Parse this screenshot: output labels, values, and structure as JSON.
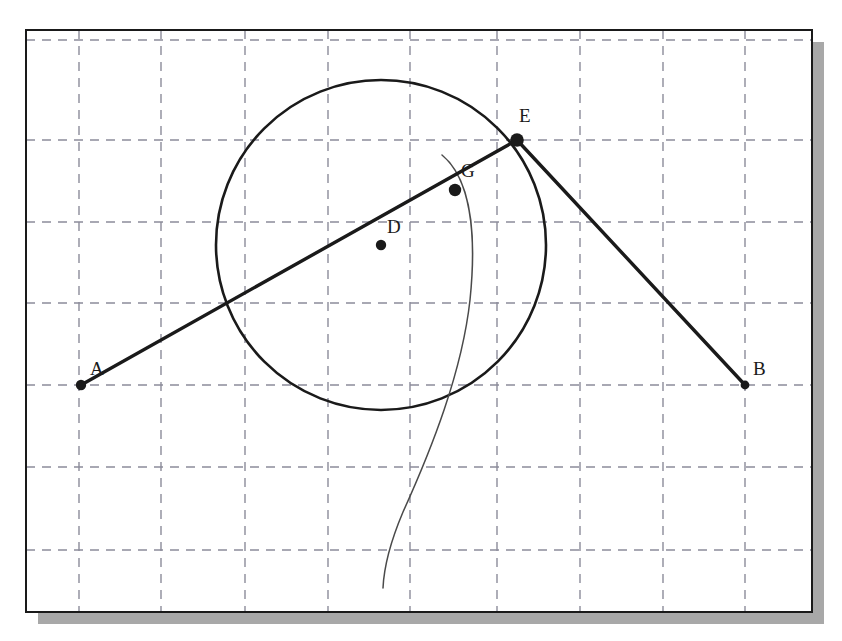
{
  "figure": {
    "background_color": "#ffffff",
    "cropped_text_above": "",
    "frame": {
      "name": "drawing-frame",
      "x": 26,
      "y": 30,
      "width": 786,
      "height": 582,
      "border_color": "#1a1a1a",
      "border_width": 2,
      "fill": "#ffffff",
      "shadow_color": "#a8a8a8",
      "shadow_offset_x": 12,
      "shadow_offset_y": 12
    },
    "grid": {
      "name": "dashed-grid",
      "color": "#8c8c9a",
      "stroke_width": 1.4,
      "dash": "9,7",
      "vertical_x": [
        79,
        161,
        245,
        328,
        410,
        497,
        580,
        663,
        745
      ],
      "horizontal_y": [
        40,
        140,
        222,
        303,
        385,
        467,
        550
      ]
    },
    "circle": {
      "name": "main-circle",
      "center_label": "D",
      "cx": 381,
      "cy": 245,
      "r": 165,
      "stroke_color": "#1a1a1a",
      "stroke_width": 2.6,
      "fill": "none"
    },
    "arc": {
      "name": "thin-construction-arc",
      "stroke_color": "#4a4a4a",
      "stroke_width": 1.5,
      "path": "M 442 155 C 470 178 477 232 470 300 C 462 372 432 448 403 512 C 392 538 384 566 383 588",
      "start": [
        442,
        155
      ],
      "end": [
        383,
        588
      ]
    },
    "segments": [
      {
        "name": "segment-a-to-e",
        "from_label": "A",
        "to_label": "E",
        "x1": 81,
        "y1": 385,
        "x2": 517,
        "y2": 140,
        "stroke_color": "#1a1a1a",
        "stroke_width": 3.4
      },
      {
        "name": "segment-e-to-b",
        "from_label": "E",
        "to_label": "B",
        "x1": 517,
        "y1": 140,
        "x2": 745,
        "y2": 385,
        "stroke_color": "#1a1a1a",
        "stroke_width": 3.4
      }
    ],
    "points": [
      {
        "name": "point-a",
        "label": "A",
        "x": 81,
        "y": 385,
        "radius": 5.2,
        "label_dx": 9,
        "label_dy": -10,
        "color": "#1a1a1a"
      },
      {
        "name": "point-d",
        "label": "D",
        "x": 381,
        "y": 245,
        "radius": 5.2,
        "label_dx": 6,
        "label_dy": -12,
        "color": "#1a1a1a"
      },
      {
        "name": "point-g",
        "label": "G",
        "x": 455,
        "y": 190,
        "radius": 6.2,
        "label_dx": 6,
        "label_dy": -13,
        "color": "#1a1a1a"
      },
      {
        "name": "point-e",
        "label": "E",
        "x": 517,
        "y": 140,
        "radius": 6.8,
        "label_dx": 2,
        "label_dy": -18,
        "color": "#1a1a1a"
      },
      {
        "name": "point-b",
        "label": "B",
        "x": 745,
        "y": 385,
        "radius": 4.4,
        "label_dx": 8,
        "label_dy": -10,
        "color": "#1a1a1a"
      }
    ],
    "label_style": {
      "font_size": 19,
      "color": "#1a1a1a"
    }
  }
}
